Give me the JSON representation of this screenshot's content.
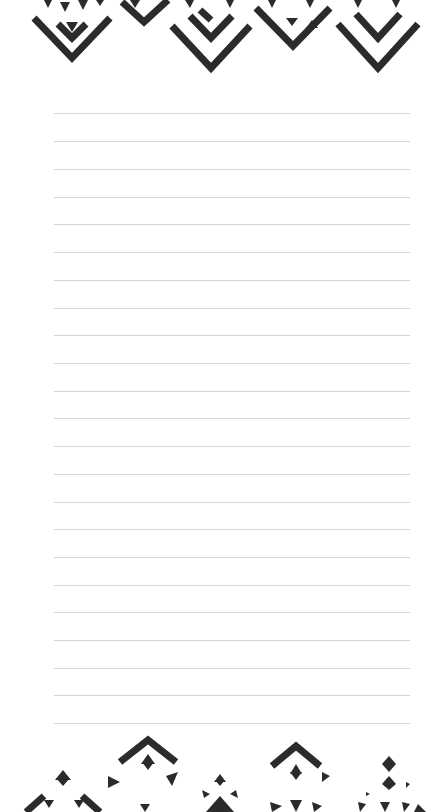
{
  "page": {
    "type": "lined-notepad-page",
    "background": "#ffffff",
    "ink_color": "#2b2b2b",
    "rule_color": "#d4d4d4"
  },
  "rules": {
    "count": 23,
    "x_start": 54,
    "x_end": 410,
    "y_positions": [
      113,
      141,
      169,
      197,
      224,
      252,
      280,
      308,
      335,
      363,
      391,
      418,
      446,
      474,
      502,
      529,
      557,
      585,
      612,
      640,
      668,
      695,
      723
    ]
  },
  "decorations": {
    "top": {
      "name": "geometric-diamond-border-top",
      "motifs": [
        {
          "cx": 72,
          "tip_y": 62,
          "size": 40
        },
        {
          "cx": 150,
          "tip_y": 22,
          "size": 24
        },
        {
          "cx": 211,
          "tip_y": 70,
          "size": 42
        },
        {
          "cx": 293,
          "tip_y": 48,
          "size": 38
        },
        {
          "cx": 378,
          "tip_y": 70,
          "size": 42
        }
      ]
    },
    "bottom": {
      "name": "geometric-diamond-border-bottom",
      "motifs": [
        {
          "cx": 63,
          "apex_y": 768,
          "size": 40
        },
        {
          "cx": 148,
          "apex_y": 738,
          "size": 30
        },
        {
          "cx": 220,
          "apex_y": 775,
          "size": 32
        },
        {
          "cx": 296,
          "apex_y": 745,
          "size": 28
        },
        {
          "cx": 389,
          "apex_y": 760,
          "size": 32
        }
      ]
    }
  }
}
